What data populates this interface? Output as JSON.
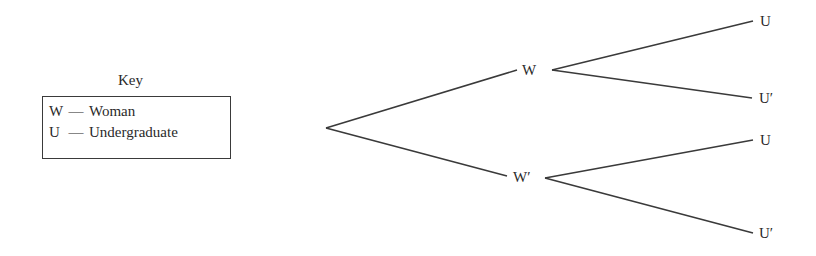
{
  "key": {
    "title": "Key",
    "entries": [
      {
        "symbol": "W",
        "dash": "—",
        "meaning": "Woman"
      },
      {
        "symbol": "U",
        "dash": "—",
        "meaning": "Undergraduate"
      }
    ]
  },
  "tree": {
    "root": {
      "x": 326,
      "y": 128
    },
    "level1": [
      {
        "label": "W",
        "x": 551,
        "y": 70,
        "line_end": {
          "x": 517,
          "y": 70
        }
      },
      {
        "label": "W′",
        "x": 545,
        "y": 178,
        "line_end": {
          "x": 505,
          "y": 176
        }
      }
    ],
    "level2": [
      {
        "parent": "W",
        "label": "U",
        "line_end": {
          "x": 753,
          "y": 21
        }
      },
      {
        "parent": "W",
        "label": "U′",
        "line_end": {
          "x": 752,
          "y": 98
        }
      },
      {
        "parent": "W′",
        "label": "U",
        "line_end": {
          "x": 753,
          "y": 140
        }
      },
      {
        "parent": "W′",
        "label": "U′",
        "line_end": {
          "x": 753,
          "y": 233
        }
      }
    ]
  },
  "colors": {
    "line": "#3a3a3a",
    "text": "#2a2a2a"
  }
}
